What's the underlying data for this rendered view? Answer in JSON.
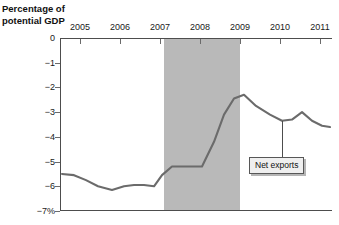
{
  "chart_data": {
    "type": "line",
    "title": "Percentage of\npotential GDP",
    "xlabel": "",
    "ylabel": "Percentage of potential GDP",
    "xlim": [
      2004.5,
      2011.3
    ],
    "ylim": [
      -7,
      0
    ],
    "grid": false,
    "legend_position": "inline-annotation",
    "x_ticks": [
      "2005",
      "2006",
      "2007",
      "2008",
      "2009",
      "2010",
      "2011"
    ],
    "x_tick_values": [
      2005,
      2006,
      2007,
      2008,
      2009,
      2010,
      2011
    ],
    "y_ticks": [
      "0",
      "−1",
      "−2",
      "−3",
      "−4",
      "−5",
      "−6",
      "−7%"
    ],
    "y_tick_values": [
      0,
      -1,
      -2,
      -3,
      -4,
      -5,
      -6,
      -7
    ],
    "series": [
      {
        "name": "Net exports",
        "color": "#6b6b6b",
        "x": [
          2004.55,
          2004.85,
          2005.15,
          2005.45,
          2005.8,
          2006.1,
          2006.35,
          2006.6,
          2006.85,
          2007.05,
          2007.3,
          2007.55,
          2007.8,
          2008.05,
          2008.35,
          2008.6,
          2008.85,
          2009.1,
          2009.4,
          2009.75,
          2010.05,
          2010.3,
          2010.55,
          2010.8,
          2011.05,
          2011.25
        ],
        "values": [
          -5.5,
          -5.55,
          -5.75,
          -6.0,
          -6.15,
          -6.0,
          -5.95,
          -5.95,
          -6.0,
          -5.55,
          -5.2,
          -5.2,
          -5.2,
          -5.2,
          -4.2,
          -3.1,
          -2.45,
          -2.3,
          -2.75,
          -3.1,
          -3.35,
          -3.3,
          -3.0,
          -3.35,
          -3.55,
          -3.6
        ]
      }
    ],
    "annotations": [
      {
        "name": "net-exports-callout",
        "text": "Net exports",
        "points_to_x": 2010.05,
        "points_to_y": -3.35
      }
    ],
    "shaded_regions": [
      {
        "name": "recession-band",
        "x_start": 2007.1,
        "x_end": 2009.0,
        "color": "#b9b9b9"
      }
    ],
    "colors": {
      "line": "#6b6b6b",
      "axis": "#4d4d4d",
      "recession": "#b9b9b9",
      "callout_bg": "#efefef",
      "callout_border": "#575757",
      "text": "#1a1a1a",
      "background": "#ffffff"
    }
  }
}
